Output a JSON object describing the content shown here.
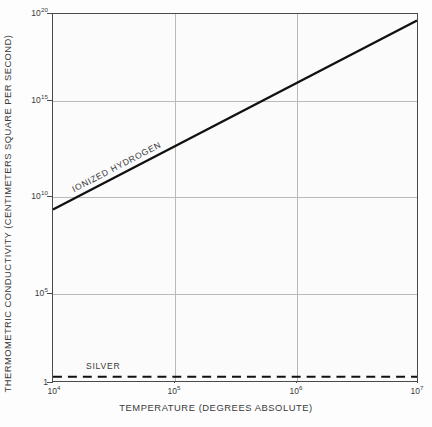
{
  "chart_data": {
    "type": "line",
    "title": "",
    "xlabel": "TEMPERATURE (DEGREES ABSOLUTE)",
    "ylabel": "THERMOMETRIC CONDUCTIVITY (CENTIMETERS SQUARE PER SECOND)",
    "xscale": "log",
    "yscale": "log",
    "xlim": [
      10000,
      10000000
    ],
    "ylim": [
      1,
      1e+20
    ],
    "grid": true,
    "legend": "inline-annotations",
    "xticks": [
      {
        "value": 10000,
        "label": "10",
        "exponent": "4"
      },
      {
        "value": 100000,
        "label": "10",
        "exponent": "5"
      },
      {
        "value": 1000000,
        "label": "10",
        "exponent": "6"
      },
      {
        "value": 10000000,
        "label": "10",
        "exponent": "7"
      }
    ],
    "yticks": [
      {
        "value": 1e+20,
        "label": "10",
        "exponent": "20"
      },
      {
        "value": 1000000000000000.0,
        "label": "10",
        "exponent": "15"
      },
      {
        "value": 10000000000.0,
        "label": "10",
        "exponent": "10"
      },
      {
        "value": 100000.0,
        "label": "10",
        "exponent": "5"
      },
      {
        "value": 1,
        "label": "1",
        "exponent": ""
      }
    ],
    "series": [
      {
        "name": "IONIZED HYDROGEN",
        "style": "solid",
        "label": "IONIZED HYDROGEN",
        "x": [
          10000,
          10000000
        ],
        "y": [
          2200000000.0,
          4.4e+19
        ],
        "points": [
          {
            "x": 10000,
            "y": 2200000000.0
          },
          {
            "x": 100000,
            "y": 700000000000.0
          },
          {
            "x": 1000000,
            "y": 220000000000000.0
          },
          {
            "x": 10000000,
            "y": 4.4e+19
          }
        ]
      },
      {
        "name": "SILVER",
        "style": "dashed",
        "label": "SILVER",
        "x": [
          10000,
          10000000
        ],
        "y": [
          1.7,
          1.7
        ],
        "points": [
          {
            "x": 10000,
            "y": 1.7
          },
          {
            "x": 10000000,
            "y": 1.7
          }
        ]
      }
    ],
    "colors": {
      "line": "#111111",
      "grid": "#b9b9b9",
      "frame": "#4a4a4a",
      "background": "#fbfbfb",
      "text": "#3a3a3a"
    }
  }
}
